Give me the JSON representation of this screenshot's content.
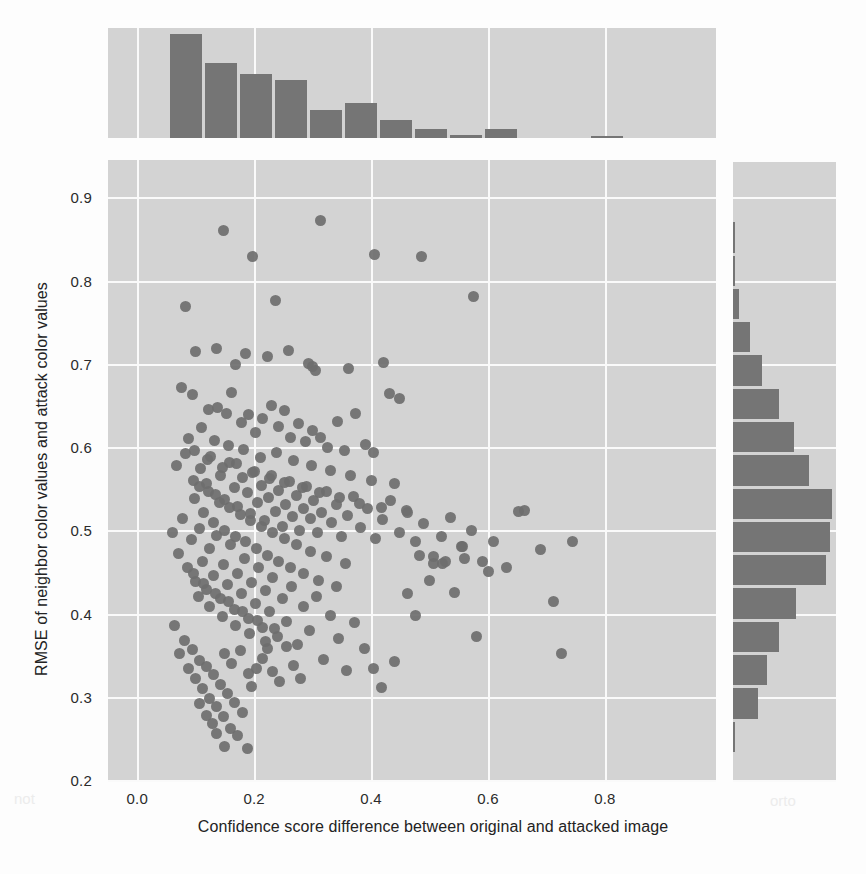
{
  "chart_data": {
    "type": "scatter",
    "title": "",
    "xlabel": "Confidence score difference between original and attacked image",
    "ylabel": "RMSE of neighbor color values and attack color values",
    "xlim": [
      -0.05,
      0.99
    ],
    "ylim": [
      0.2,
      0.945
    ],
    "xticks": [
      "0.0",
      "0.2",
      "0.4",
      "0.6",
      "0.8"
    ],
    "xtick_values": [
      0.0,
      0.2,
      0.4,
      0.6,
      0.8
    ],
    "yticks": [
      "0.2",
      "0.3",
      "0.4",
      "0.5",
      "0.6",
      "0.7",
      "0.8",
      "0.9"
    ],
    "ytick_values": [
      0.2,
      0.3,
      0.4,
      0.5,
      0.6,
      0.7,
      0.8,
      0.9
    ],
    "grid": true,
    "legend": "none",
    "marker_color": "#6e6e6e",
    "hist_color": "#757575",
    "panel_color": "#d3d3d3",
    "grid_color": "#fafafa",
    "points": [
      [
        0.083,
        0.769
      ],
      [
        0.147,
        0.86
      ],
      [
        0.197,
        0.829
      ],
      [
        0.236,
        0.776
      ],
      [
        0.313,
        0.872
      ],
      [
        0.405,
        0.831
      ],
      [
        0.487,
        0.829
      ],
      [
        0.575,
        0.781
      ],
      [
        0.1,
        0.715
      ],
      [
        0.136,
        0.719
      ],
      [
        0.168,
        0.699
      ],
      [
        0.186,
        0.713
      ],
      [
        0.222,
        0.709
      ],
      [
        0.258,
        0.716
      ],
      [
        0.293,
        0.7
      ],
      [
        0.299,
        0.697
      ],
      [
        0.305,
        0.692
      ],
      [
        0.362,
        0.695
      ],
      [
        0.422,
        0.702
      ],
      [
        0.432,
        0.664
      ],
      [
        0.448,
        0.659
      ],
      [
        0.075,
        0.672
      ],
      [
        0.094,
        0.663
      ],
      [
        0.122,
        0.645
      ],
      [
        0.138,
        0.648
      ],
      [
        0.152,
        0.64
      ],
      [
        0.161,
        0.666
      ],
      [
        0.178,
        0.63
      ],
      [
        0.19,
        0.639
      ],
      [
        0.203,
        0.617
      ],
      [
        0.214,
        0.634
      ],
      [
        0.229,
        0.65
      ],
      [
        0.241,
        0.625
      ],
      [
        0.252,
        0.644
      ],
      [
        0.263,
        0.611
      ],
      [
        0.276,
        0.628
      ],
      [
        0.288,
        0.607
      ],
      [
        0.3,
        0.62
      ],
      [
        0.314,
        0.612
      ],
      [
        0.326,
        0.6
      ],
      [
        0.342,
        0.631
      ],
      [
        0.355,
        0.596
      ],
      [
        0.373,
        0.64
      ],
      [
        0.39,
        0.603
      ],
      [
        0.404,
        0.593
      ],
      [
        0.068,
        0.578
      ],
      [
        0.082,
        0.592
      ],
      [
        0.096,
        0.56
      ],
      [
        0.108,
        0.574
      ],
      [
        0.118,
        0.556
      ],
      [
        0.126,
        0.589
      ],
      [
        0.134,
        0.543
      ],
      [
        0.142,
        0.566
      ],
      [
        0.15,
        0.537
      ],
      [
        0.158,
        0.582
      ],
      [
        0.166,
        0.551
      ],
      [
        0.172,
        0.529
      ],
      [
        0.18,
        0.563
      ],
      [
        0.188,
        0.545
      ],
      [
        0.194,
        0.52
      ],
      [
        0.2,
        0.571
      ],
      [
        0.206,
        0.534
      ],
      [
        0.212,
        0.554
      ],
      [
        0.218,
        0.512
      ],
      [
        0.224,
        0.54
      ],
      [
        0.23,
        0.566
      ],
      [
        0.236,
        0.523
      ],
      [
        0.242,
        0.548
      ],
      [
        0.248,
        0.505
      ],
      [
        0.254,
        0.531
      ],
      [
        0.26,
        0.559
      ],
      [
        0.266,
        0.517
      ],
      [
        0.272,
        0.542
      ],
      [
        0.278,
        0.5
      ],
      [
        0.284,
        0.526
      ],
      [
        0.29,
        0.553
      ],
      [
        0.296,
        0.514
      ],
      [
        0.302,
        0.536
      ],
      [
        0.308,
        0.497
      ],
      [
        0.316,
        0.521
      ],
      [
        0.324,
        0.547
      ],
      [
        0.332,
        0.509
      ],
      [
        0.34,
        0.531
      ],
      [
        0.35,
        0.493
      ],
      [
        0.36,
        0.518
      ],
      [
        0.37,
        0.541
      ],
      [
        0.382,
        0.503
      ],
      [
        0.394,
        0.526
      ],
      [
        0.408,
        0.49
      ],
      [
        0.42,
        0.513
      ],
      [
        0.434,
        0.536
      ],
      [
        0.448,
        0.498
      ],
      [
        0.462,
        0.521
      ],
      [
        0.476,
        0.486
      ],
      [
        0.49,
        0.508
      ],
      [
        0.506,
        0.469
      ],
      [
        0.52,
        0.492
      ],
      [
        0.536,
        0.515
      ],
      [
        0.555,
        0.48
      ],
      [
        0.572,
        0.5
      ],
      [
        0.59,
        0.463
      ],
      [
        0.61,
        0.487
      ],
      [
        0.632,
        0.455
      ],
      [
        0.652,
        0.523
      ],
      [
        0.662,
        0.524
      ],
      [
        0.69,
        0.477
      ],
      [
        0.712,
        0.414
      ],
      [
        0.725,
        0.352
      ],
      [
        0.745,
        0.487
      ],
      [
        0.06,
        0.498
      ],
      [
        0.07,
        0.472
      ],
      [
        0.078,
        0.514
      ],
      [
        0.086,
        0.455
      ],
      [
        0.092,
        0.489
      ],
      [
        0.1,
        0.438
      ],
      [
        0.106,
        0.502
      ],
      [
        0.112,
        0.463
      ],
      [
        0.118,
        0.429
      ],
      [
        0.124,
        0.478
      ],
      [
        0.13,
        0.446
      ],
      [
        0.136,
        0.494
      ],
      [
        0.142,
        0.418
      ],
      [
        0.148,
        0.459
      ],
      [
        0.154,
        0.435
      ],
      [
        0.16,
        0.483
      ],
      [
        0.166,
        0.405
      ],
      [
        0.172,
        0.448
      ],
      [
        0.178,
        0.424
      ],
      [
        0.184,
        0.466
      ],
      [
        0.19,
        0.394
      ],
      [
        0.196,
        0.437
      ],
      [
        0.202,
        0.412
      ],
      [
        0.208,
        0.455
      ],
      [
        0.214,
        0.383
      ],
      [
        0.22,
        0.428
      ],
      [
        0.226,
        0.402
      ],
      [
        0.232,
        0.443
      ],
      [
        0.24,
        0.373
      ],
      [
        0.248,
        0.418
      ],
      [
        0.256,
        0.391
      ],
      [
        0.264,
        0.432
      ],
      [
        0.274,
        0.363
      ],
      [
        0.284,
        0.408
      ],
      [
        0.294,
        0.38
      ],
      [
        0.306,
        0.421
      ],
      [
        0.318,
        0.345
      ],
      [
        0.33,
        0.398
      ],
      [
        0.344,
        0.37
      ],
      [
        0.358,
        0.332
      ],
      [
        0.372,
        0.389
      ],
      [
        0.388,
        0.358
      ],
      [
        0.404,
        0.334
      ],
      [
        0.418,
        0.311
      ],
      [
        0.064,
        0.386
      ],
      [
        0.072,
        0.352
      ],
      [
        0.08,
        0.368
      ],
      [
        0.088,
        0.334
      ],
      [
        0.094,
        0.357
      ],
      [
        0.1,
        0.322
      ],
      [
        0.106,
        0.344
      ],
      [
        0.112,
        0.31
      ],
      [
        0.118,
        0.336
      ],
      [
        0.124,
        0.298
      ],
      [
        0.13,
        0.327
      ],
      [
        0.136,
        0.288
      ],
      [
        0.142,
        0.315
      ],
      [
        0.148,
        0.276
      ],
      [
        0.154,
        0.304
      ],
      [
        0.16,
        0.262
      ],
      [
        0.166,
        0.293
      ],
      [
        0.172,
        0.254
      ],
      [
        0.18,
        0.281
      ],
      [
        0.188,
        0.238
      ],
      [
        0.196,
        0.312
      ],
      [
        0.204,
        0.334
      ],
      [
        0.214,
        0.346
      ],
      [
        0.222,
        0.358
      ],
      [
        0.232,
        0.33
      ],
      [
        0.244,
        0.318
      ],
      [
        0.256,
        0.36
      ],
      [
        0.268,
        0.338
      ],
      [
        0.28,
        0.322
      ],
      [
        0.088,
        0.61
      ],
      [
        0.098,
        0.596
      ],
      [
        0.11,
        0.623
      ],
      [
        0.12,
        0.585
      ],
      [
        0.132,
        0.608
      ],
      [
        0.146,
        0.575
      ],
      [
        0.156,
        0.602
      ],
      [
        0.17,
        0.58
      ],
      [
        0.182,
        0.597
      ],
      [
        0.198,
        0.57
      ],
      [
        0.21,
        0.588
      ],
      [
        0.226,
        0.562
      ],
      [
        0.238,
        0.593
      ],
      [
        0.252,
        0.558
      ],
      [
        0.268,
        0.584
      ],
      [
        0.282,
        0.552
      ],
      [
        0.298,
        0.578
      ],
      [
        0.312,
        0.545
      ],
      [
        0.33,
        0.572
      ],
      [
        0.346,
        0.54
      ],
      [
        0.364,
        0.566
      ],
      [
        0.38,
        0.532
      ],
      [
        0.4,
        0.56
      ],
      [
        0.418,
        0.528
      ],
      [
        0.44,
        0.556
      ],
      [
        0.46,
        0.524
      ],
      [
        0.482,
        0.47
      ],
      [
        0.5,
        0.44
      ],
      [
        0.522,
        0.46
      ],
      [
        0.542,
        0.425
      ],
      [
        0.56,
        0.466
      ],
      [
        0.58,
        0.372
      ],
      [
        0.6,
        0.45
      ],
      [
        0.44,
        0.342
      ],
      [
        0.462,
        0.424
      ],
      [
        0.476,
        0.398
      ],
      [
        0.506,
        0.46
      ],
      [
        0.528,
        0.462
      ],
      [
        0.556,
        0.48
      ],
      [
        0.098,
        0.538
      ],
      [
        0.106,
        0.553
      ],
      [
        0.114,
        0.522
      ],
      [
        0.122,
        0.547
      ],
      [
        0.13,
        0.509
      ],
      [
        0.14,
        0.533
      ],
      [
        0.15,
        0.5
      ],
      [
        0.158,
        0.527
      ],
      [
        0.168,
        0.493
      ],
      [
        0.176,
        0.519
      ],
      [
        0.186,
        0.486
      ],
      [
        0.194,
        0.512
      ],
      [
        0.204,
        0.478
      ],
      [
        0.212,
        0.505
      ],
      [
        0.222,
        0.47
      ],
      [
        0.232,
        0.498
      ],
      [
        0.242,
        0.462
      ],
      [
        0.252,
        0.49
      ],
      [
        0.262,
        0.455
      ],
      [
        0.272,
        0.483
      ],
      [
        0.284,
        0.448
      ],
      [
        0.296,
        0.475
      ],
      [
        0.31,
        0.44
      ],
      [
        0.324,
        0.468
      ],
      [
        0.34,
        0.433
      ],
      [
        0.356,
        0.46
      ],
      [
        0.096,
        0.448
      ],
      [
        0.104,
        0.42
      ],
      [
        0.114,
        0.436
      ],
      [
        0.124,
        0.408
      ],
      [
        0.134,
        0.424
      ],
      [
        0.146,
        0.396
      ],
      [
        0.156,
        0.414
      ],
      [
        0.168,
        0.386
      ],
      [
        0.18,
        0.402
      ],
      [
        0.192,
        0.376
      ],
      [
        0.206,
        0.392
      ],
      [
        0.22,
        0.366
      ],
      [
        0.234,
        0.382
      ],
      [
        0.15,
        0.352
      ],
      [
        0.162,
        0.34
      ],
      [
        0.176,
        0.356
      ],
      [
        0.19,
        0.328
      ],
      [
        0.128,
        0.268
      ],
      [
        0.136,
        0.256
      ],
      [
        0.15,
        0.24
      ],
      [
        0.106,
        0.292
      ],
      [
        0.118,
        0.278
      ]
    ],
    "top_histogram": {
      "orientation": "vertical",
      "bin_edges": [
        0.053,
        0.113,
        0.173,
        0.233,
        0.293,
        0.353,
        0.413,
        0.473,
        0.533,
        0.593,
        0.653,
        0.713,
        0.773,
        0.833,
        0.893
      ],
      "counts": [
        68,
        49,
        42,
        38,
        18,
        23,
        12,
        6,
        2,
        6,
        0,
        0,
        1,
        0
      ],
      "max_count": 68
    },
    "right_histogram": {
      "orientation": "horizontal",
      "bin_edges": [
        0.232,
        0.272,
        0.312,
        0.352,
        0.392,
        0.432,
        0.472,
        0.512,
        0.552,
        0.592,
        0.632,
        0.672,
        0.712,
        0.752,
        0.792,
        0.832,
        0.872
      ],
      "counts": [
        1,
        12,
        16,
        22,
        30,
        44,
        46,
        47,
        36,
        29,
        22,
        14,
        8,
        3,
        1,
        1
      ],
      "max_count": 47
    }
  }
}
